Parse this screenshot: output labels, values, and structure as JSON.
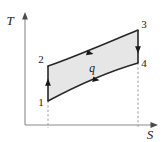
{
  "figure": {
    "kind": "temperature-entropy-cycle-diagram",
    "background_color": "#ffffff",
    "region_fill_color": "#e6e6e6",
    "curve_color": "#262626",
    "axis_color": "#8a8a8a",
    "dashed_color": "#9a9a9a"
  },
  "axes": {
    "y_label": "T",
    "x_label": "S",
    "y_axis_name": "Temperature",
    "x_axis_name": "Entropy",
    "grid": "off",
    "ticks": "none"
  },
  "states": [
    {
      "id": "1",
      "label": "1",
      "x": 48,
      "y": 101,
      "label_x": 41,
      "label_y": 106
    },
    {
      "id": "2",
      "label": "2",
      "x": 48,
      "y": 66,
      "label_x": 41,
      "label_y": 63
    },
    {
      "id": "3",
      "label": "3",
      "x": 138,
      "y": 30,
      "label_x": 143,
      "label_y": 28
    },
    {
      "id": "4",
      "label": "4",
      "x": 138,
      "y": 63,
      "label_x": 143,
      "label_y": 66
    }
  ],
  "processes": [
    {
      "from": "1",
      "to": "2",
      "type": "vertical",
      "direction": "up",
      "note": "isentropic compression"
    },
    {
      "from": "2",
      "to": "3",
      "type": "curve",
      "direction": "right",
      "note": "heat addition"
    },
    {
      "from": "3",
      "to": "4",
      "type": "vertical",
      "direction": "down",
      "note": "isentropic expansion"
    },
    {
      "from": "4",
      "to": "1",
      "type": "curve",
      "direction": "left",
      "note": "heat rejection"
    }
  ],
  "annotations": {
    "heat_label": "q",
    "heat_label_x": 92,
    "heat_label_y": 72
  }
}
